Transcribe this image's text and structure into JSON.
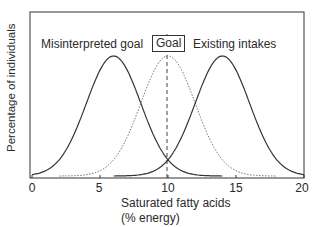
{
  "chart_data": {
    "type": "line",
    "title": "",
    "xlabel": "Saturated fatty acids (% energy)",
    "xlabel_line1": "Saturated fatty acids",
    "xlabel_line2": "(% energy)",
    "ylabel": "Percentage of individuals",
    "xlim": [
      0,
      20
    ],
    "x_ticks": [
      "0",
      "5",
      "10",
      "15",
      "20"
    ],
    "y_ticks": [],
    "grid": false,
    "legend": "none",
    "series": [
      {
        "name": "Misinterpreted goal",
        "style": "solid",
        "mean": 6,
        "sd": 2,
        "peak": 1.0
      },
      {
        "name": "Goal",
        "style": "dotted",
        "mean": 10,
        "sd": 2,
        "peak": 1.0
      },
      {
        "name": "Existing intakes",
        "style": "solid",
        "mean": 14,
        "sd": 2,
        "peak": 1.0
      }
    ],
    "annotations": [
      {
        "text": "Misinterpreted goal",
        "x": 6
      },
      {
        "text": "Goal",
        "x": 10,
        "boxed": true,
        "vertical_dashed_line": true
      },
      {
        "text": "Existing intakes",
        "x": 14
      }
    ]
  },
  "labels": {
    "misinterpreted": "Misinterpreted goal",
    "goal": "Goal",
    "existing": "Existing intakes",
    "xlabel_line1": "Saturated fatty acids",
    "xlabel_line2": "(% energy)",
    "ylabel": "Percentage of individuals",
    "ticks": [
      "0",
      "5",
      "10",
      "15",
      "20"
    ]
  }
}
